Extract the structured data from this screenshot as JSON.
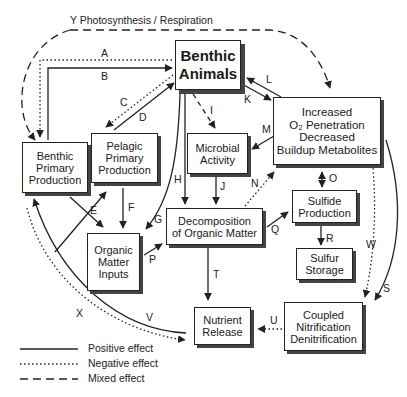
{
  "title": "Y Photosynthesis / Respiration",
  "nodes": {
    "benthic_animals": "Benthic Animals",
    "increased_o2": [
      "Increased",
      "O₂ Penetration",
      "Decreased",
      "Buildup Metabolites"
    ],
    "benthic_primary": [
      "Benthic",
      "Primary",
      "Production"
    ],
    "pelagic_primary": [
      "Pelagic",
      "Primary",
      "Production"
    ],
    "microbial": [
      "Microbial",
      "Activity"
    ],
    "decomposition": [
      "Decomposition",
      "of Organic Matter"
    ],
    "sulfide": [
      "Sulfide",
      "Production"
    ],
    "sulfur": [
      "Sulfur",
      "Storage"
    ],
    "organic_inputs": [
      "Organic",
      "Matter",
      "Inputs"
    ],
    "nutrient": [
      "Nutrient",
      "Release"
    ],
    "coupled": [
      "Coupled",
      "Nitrification",
      "Denitrification"
    ]
  },
  "edge_labels": {
    "A": "A",
    "B": "B",
    "C": "C",
    "D": "D",
    "E": "E",
    "F": "F",
    "G": "G",
    "H": "H",
    "I": "I",
    "J": "J",
    "K": "K",
    "L": "L",
    "M": "M",
    "N": "N",
    "O": "O",
    "P": "P",
    "Q": "Q",
    "R": "R",
    "S": "S",
    "T": "T",
    "U": "U",
    "V": "V",
    "W": "W",
    "X": "X"
  },
  "legend": {
    "positive": "Positive effect",
    "negative": "Negative effect",
    "mixed": "Mixed effect"
  }
}
